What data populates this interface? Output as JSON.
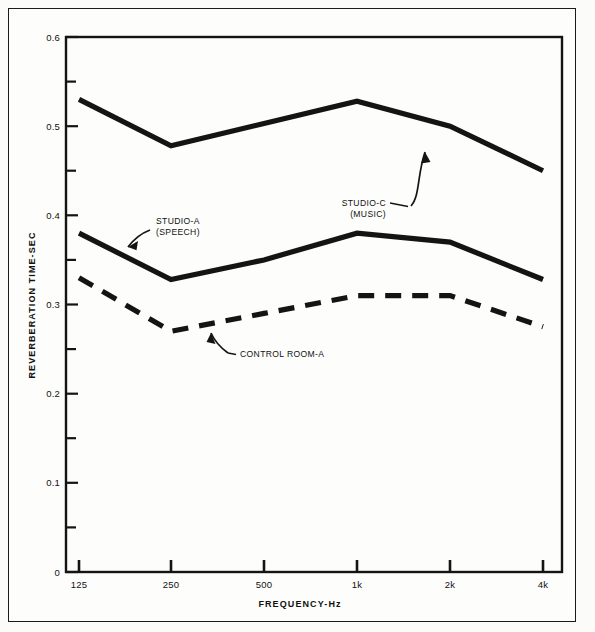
{
  "figure": {
    "background_color": "#fbfbfa",
    "ink_color": "#141414",
    "frame": "outer-rule-box"
  },
  "chart_data": {
    "type": "line",
    "title": "",
    "xlabel": "FREQUENCY-Hz",
    "ylabel": "REVERBERATION TIME-SEC",
    "categories": [
      "125",
      "250",
      "500",
      "1k",
      "2k",
      "4k"
    ],
    "x_tick_labels": [
      "125",
      "250",
      "500",
      "1k",
      "2k",
      "4k"
    ],
    "y_tick_labels": [
      "0",
      "0.1",
      "0.2",
      "0.3",
      "0.4",
      "0.5",
      "0.6"
    ],
    "y_major_ticks": [
      0,
      0.1,
      0.2,
      0.3,
      0.4,
      0.5,
      0.6
    ],
    "y_minor_ticks": [
      0.05,
      0.15,
      0.25,
      0.35,
      0.45,
      0.55
    ],
    "ylim": [
      0,
      0.6
    ],
    "grid": false,
    "legend": "inline-annotations",
    "series": [
      {
        "name": "STUDIO-C (MUSIC)",
        "style": "solid",
        "values": [
          0.53,
          0.478,
          0.503,
          0.528,
          0.5,
          0.45
        ]
      },
      {
        "name": "STUDIO-A (SPEECH)",
        "style": "solid",
        "values": [
          0.38,
          0.328,
          0.35,
          0.38,
          0.37,
          0.328
        ]
      },
      {
        "name": "CONTROL ROOM-A",
        "style": "dashed",
        "values": [
          0.33,
          0.27,
          0.29,
          0.31,
          0.31,
          0.275
        ]
      }
    ],
    "annotations": [
      {
        "label_line1": "STUDIO-C",
        "label_line2": "(MUSIC)",
        "points_to": "STUDIO-C (MUSIC)"
      },
      {
        "label_line1": "STUDIO-A",
        "label_line2": "(SPEECH)",
        "points_to": "STUDIO-A (SPEECH)"
      },
      {
        "label_line1": "CONTROL ROOM-A",
        "label_line2": "",
        "points_to": "CONTROL ROOM-A"
      }
    ]
  }
}
